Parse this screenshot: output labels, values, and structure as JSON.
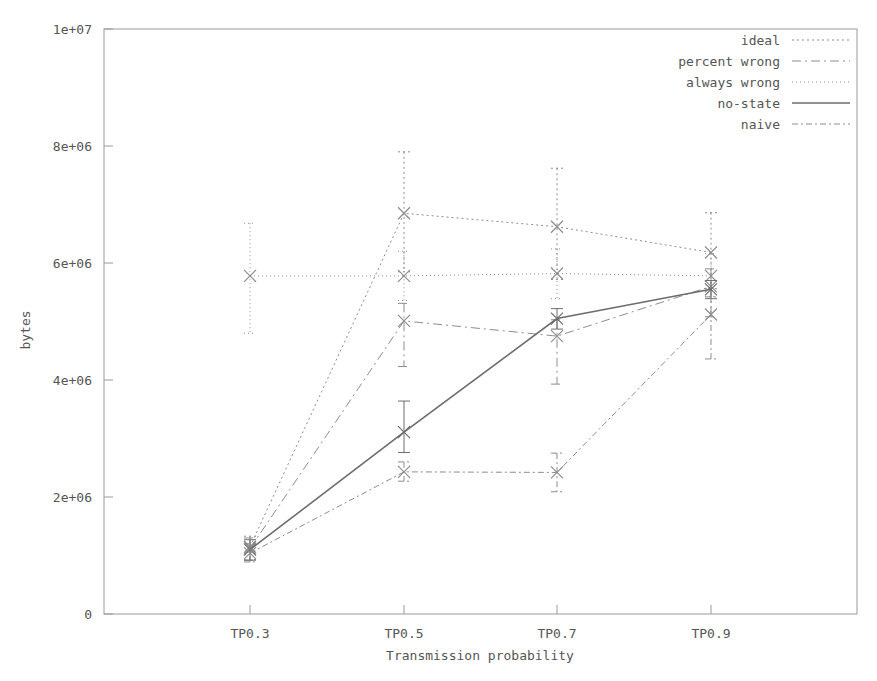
{
  "chart_data": {
    "type": "line",
    "title": "",
    "xlabel": "Transmission probability",
    "ylabel": "bytes",
    "categories": [
      "TP0.3",
      "TP0.5",
      "TP0.7",
      "TP0.9"
    ],
    "ytick_labels": [
      "0",
      "2e+06",
      "4e+06",
      "6e+06",
      "8e+06",
      "1e+07"
    ],
    "ytick_values": [
      0,
      2000000,
      4000000,
      6000000,
      8000000,
      10000000
    ],
    "ylim": [
      0,
      10000000
    ],
    "grid": false,
    "legend_position": "top-right",
    "error_bars": true,
    "marker": "x",
    "series": [
      {
        "name": "ideal",
        "dash": "2,3",
        "color": "#8d8d8d",
        "width": 1,
        "values": [
          1150000,
          6850000,
          6620000,
          6180000
        ],
        "err_low": [
          220000,
          1000000,
          900000,
          620000
        ],
        "err_high": [
          180000,
          1050000,
          1000000,
          680000
        ]
      },
      {
        "name": "percent wrong",
        "dash": "9,4,2,4",
        "color": "#8d8d8d",
        "width": 1,
        "values": [
          1120000,
          5010000,
          4750000,
          5600000
        ],
        "err_low": [
          200000,
          780000,
          820000,
          520000
        ],
        "err_high": [
          180000,
          300000,
          280000,
          300000
        ]
      },
      {
        "name": "always wrong",
        "dash": "1,3",
        "color": "#8d8d8d",
        "width": 1,
        "values": [
          5780000,
          5780000,
          5820000,
          5780000
        ],
        "err_low": [
          980000,
          420000,
          430000,
          350000
        ],
        "err_high": [
          900000,
          420000,
          420000,
          380000
        ]
      },
      {
        "name": "no-state",
        "dash": "none",
        "color": "#6d6d6d",
        "width": 1.6,
        "values": [
          1100000,
          3110000,
          5050000,
          5550000
        ],
        "err_low": [
          180000,
          350000,
          180000,
          160000
        ],
        "err_high": [
          170000,
          530000,
          170000,
          150000
        ]
      },
      {
        "name": "naive",
        "dash": "6,3,2,3",
        "color": "#8d8d8d",
        "width": 1,
        "values": [
          1040000,
          2430000,
          2420000,
          5120000
        ],
        "err_low": [
          150000,
          160000,
          330000,
          760000
        ],
        "err_high": [
          160000,
          170000,
          330000,
          300000
        ]
      }
    ]
  },
  "legend": {
    "items": [
      {
        "label": "ideal"
      },
      {
        "label": "percent wrong"
      },
      {
        "label": "always wrong"
      },
      {
        "label": "no-state"
      },
      {
        "label": "naive"
      }
    ]
  }
}
